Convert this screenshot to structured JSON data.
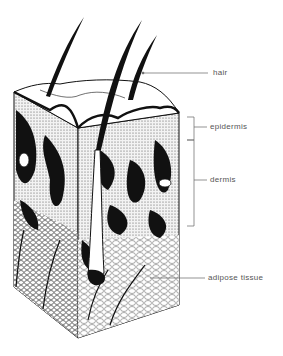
{
  "figure": {
    "ink_color": "#111111",
    "label_color": "#555555",
    "labels": [
      {
        "id": "hair",
        "text": "hair",
        "x": 213,
        "y": 68
      },
      {
        "id": "epidermis",
        "text": "epidermis",
        "x": 210,
        "y": 122
      },
      {
        "id": "dermis",
        "text": "dermis",
        "x": 210,
        "y": 175
      },
      {
        "id": "adipose",
        "text": "adipose tissue",
        "x": 208,
        "y": 273
      }
    ]
  }
}
